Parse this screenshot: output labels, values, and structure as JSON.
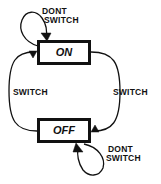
{
  "diagram": {
    "type": "state-machine",
    "title": "",
    "width": 161,
    "height": 184,
    "background_color": "#ffffff",
    "line_color": "#111111",
    "states": [
      {
        "id": "on",
        "label": "ON",
        "x": 37,
        "y": 40,
        "width": 54,
        "height": 25
      },
      {
        "id": "off",
        "label": "OFF",
        "x": 37,
        "y": 118,
        "width": 54,
        "height": 25
      }
    ],
    "transitions": [
      {
        "id": "on-self",
        "from": "on",
        "to": "on",
        "label_line1": "DONT",
        "label_line2": "SWITCH",
        "label_x": 42,
        "label_y": 13,
        "kind": "self-loop",
        "position": "top-left"
      },
      {
        "id": "on-to-off",
        "from": "on",
        "to": "off",
        "label_line1": "SWITCH",
        "label_line2": "",
        "label_x": 113,
        "label_y": 93,
        "kind": "arc",
        "position": "right"
      },
      {
        "id": "off-to-on",
        "from": "off",
        "to": "on",
        "label_line1": "SWITCH",
        "label_line2": "",
        "label_x": 13,
        "label_y": 93,
        "kind": "arc",
        "position": "left"
      },
      {
        "id": "off-self",
        "from": "off",
        "to": "off",
        "label_line1": "DONT",
        "label_line2": "SWITCH",
        "label_x": 108,
        "label_y": 150,
        "kind": "self-loop",
        "position": "bottom-right"
      }
    ]
  }
}
